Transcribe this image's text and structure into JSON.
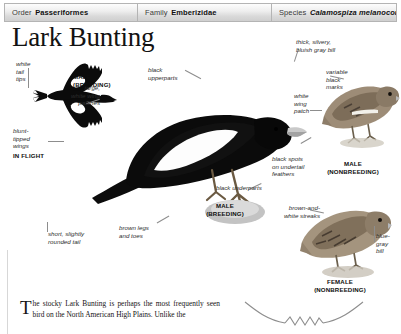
{
  "taxonomy": {
    "order_key": "Order",
    "order_value": "Passeriformes",
    "family_key": "Family",
    "family_value": "Emberizidae",
    "species_key": "Species",
    "species_value": "Calamospiza melanocorys"
  },
  "page": {
    "title": "Lark Bunting"
  },
  "annotations": {
    "white_tail_tips": "white\ntail\ntips",
    "blunt_tipped_wings": "blunt-\ntipped\nwings",
    "large_white_wing_patches": "large,\nwhite wing\npatches",
    "black_upperparts": "black\nupperparts",
    "thick_silvery_bill": "thick, silvery,\nbluish gray bill",
    "variable_black_marks": "variable\nblack\nmarks",
    "white_wing_patch": "white\nwing\npatch",
    "black_spots_undertail": "black spots\non undertail\nfeathers",
    "black_underparts": "black underparts",
    "short_rounded_tail": "short, slightly\nrounded tail",
    "brown_legs_and_toes": "brown legs\nand toes",
    "brown_and_white_streaks": "brown-and-\nwhite streaks",
    "blue_gray_bill": "blue-\ngray\nbill"
  },
  "figure_labels": {
    "male_breeding_flight": "MALE\n(BREEDING)",
    "in_flight": "IN FLIGHT",
    "male_breeding_perched": "MALE\n(BREEDING)",
    "male_nonbreeding": "MALE\n(NONBREEDING)",
    "female_nonbreeding": "FEMALE\n(NONBREEDING)"
  },
  "body": {
    "dropcap": "T",
    "paragraph": "he stocky Lark Bunting is perhaps the most frequently seen bird on the North American High Plains. Unlike the"
  },
  "colors": {
    "header_border": "#b4b4b4",
    "leader_line": "#8d8d8d",
    "text": "#1a1a1a"
  }
}
